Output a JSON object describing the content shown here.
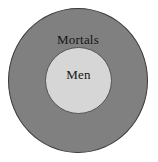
{
  "diagram": {
    "type": "euler-diagram",
    "background_color": "#ffffff",
    "outer_set": {
      "label": "Mortals",
      "fill_color": "#808080",
      "stroke_color": "#3a3a3a"
    },
    "inner_set": {
      "label": "Men",
      "fill_color": "#d6d6d6",
      "stroke_color": "#555555"
    },
    "text_color": "#141414"
  }
}
